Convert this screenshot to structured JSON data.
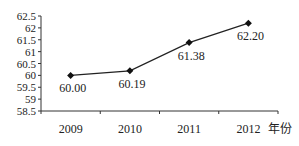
{
  "chart_data": {
    "type": "line",
    "title": "",
    "xlabel": "年份",
    "ylabel": "",
    "categories": [
      "2009",
      "2010",
      "2011",
      "2012"
    ],
    "values": [
      60.0,
      60.19,
      61.38,
      62.2
    ],
    "data_labels": [
      "60.00",
      "60.19",
      "61.38",
      "62.20"
    ],
    "ylim": [
      58.5,
      62.5
    ],
    "yticks": [
      "58.5",
      "59",
      "59.5",
      "60",
      "60.5",
      "61",
      "61.5",
      "62",
      "62.5"
    ],
    "grid": false,
    "marker": "diamond",
    "line_color": "#222222",
    "legend": null
  }
}
